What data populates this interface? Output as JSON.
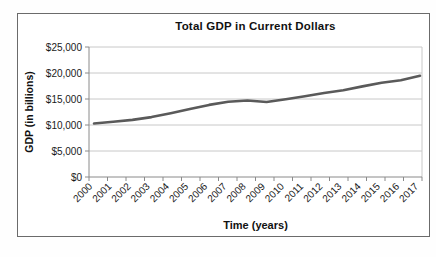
{
  "chart_data": {
    "type": "line",
    "title": "Total GDP in Current Dollars",
    "xlabel": "Time (years)",
    "ylabel": "GDP (in billions)",
    "categories": [
      "2000",
      "2001",
      "2002",
      "2003",
      "2004",
      "2005",
      "2006",
      "2007",
      "2008",
      "2009",
      "2010",
      "2011",
      "2012",
      "2013",
      "2014",
      "2015",
      "2016",
      "2017"
    ],
    "series": [
      {
        "name": "Total GDP",
        "values": [
          10285,
          10622,
          10978,
          11511,
          12275,
          13094,
          13856,
          14478,
          14719,
          14419,
          14964,
          15518,
          16155,
          16692,
          17428,
          18121,
          18625,
          19485
        ]
      }
    ],
    "ylim": [
      0,
      25000
    ],
    "ytick_step": 5000,
    "ytick_labels": [
      "$0",
      "$5,000",
      "$10,000",
      "$15,000",
      "$20,000",
      "$25,000"
    ],
    "grid": true,
    "legend": "none",
    "colors": {
      "line": "#5a5a5a",
      "grid": "#c8c8c8",
      "axis": "#8a8a8a",
      "text": "#1a1a1a",
      "frame_border": "#6b6b6b"
    }
  }
}
